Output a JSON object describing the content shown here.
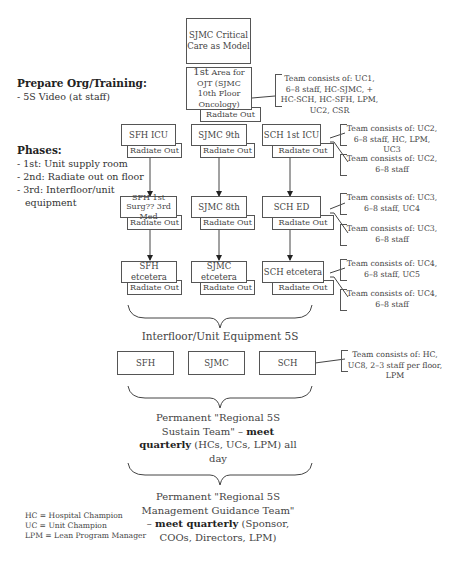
{
  "top": {
    "model_box": "SJMC Critical Care as Model",
    "ojt_box_sup": "1st",
    "ojt_box": "Area for OJT (SJMC 10th Floor Oncology)",
    "radiate": "Radiate Out",
    "ojt_team": "Team consists of: UC1, 6–8 staff, HC-SJMC, + HC-SCH, HC-SFH, LPM, UC2, CSR"
  },
  "sidebar": {
    "prepare_heading": "Prepare Org/Training:",
    "prepare_items": [
      "- 5S Video (at staff)"
    ],
    "phases_heading": "Phases:",
    "phases_items": [
      "- 1st: Unit supply room",
      "- 2nd: Radiate out on floor",
      "- 3rd: Interfloor/unit",
      "  equipment"
    ]
  },
  "rows": [
    {
      "boxes": [
        "SFH ICU",
        "SJMC 9th",
        "SCH 1st ICU"
      ],
      "radiate": "Radiate Out",
      "team_main": "Team consists of: UC2, 6–8 staff, HC, LPM, UC3",
      "team_radiate": "Team consists of: UC2, 6–8 staff"
    },
    {
      "boxes": [
        "SFH 1st Surg?? 3rd Med",
        "SJMC 8th",
        "SCH ED"
      ],
      "radiate": "Radiate Out",
      "team_main": "Team consists of: UC3, 6–8 staff, UC4",
      "team_radiate": "Team consists of: UC3, 6–8 staff"
    },
    {
      "boxes": [
        "SFH etcetera",
        "SJMC etcetera",
        "SCH etcetera"
      ],
      "radiate": "Radiate Out",
      "team_main": "Team consists of: UC4, 6–8 staff, UC5",
      "team_radiate": "Team consists of: UC4, 6–8 staff"
    }
  ],
  "equipment": {
    "title": "Interfloor/Unit Equipment 5S",
    "boxes": [
      "SFH",
      "SJMC",
      "SCH"
    ],
    "team": "Team consists of: HC, UC8, 2–3 staff per floor, LPM"
  },
  "sustain": {
    "pre": "Permanent \"Regional 5S Sustain Team\" – ",
    "bold": "meet quarterly",
    "post": " (HCs, UCs, LPM) all day"
  },
  "guidance": {
    "pre": "Permanent \"Regional 5S Management Guidance Team\" – ",
    "bold": "meet quarterly",
    "post": " (Sponsor, COOs, Directors, LPM)"
  },
  "legend": [
    "HC = Hospital Champion",
    "UC = Unit Champion",
    "LPM = Lean Program Manager"
  ]
}
